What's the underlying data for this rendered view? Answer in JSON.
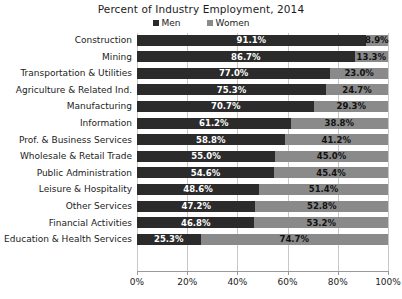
{
  "chart_data": {
    "type": "bar",
    "title": "Percent of Industry Employment, 2014",
    "xlabel": "",
    "ylabel": "",
    "orientation": "horizontal",
    "stacked": true,
    "grid": true,
    "legend_position": "top",
    "xlim": [
      0,
      100
    ],
    "xticks": [
      "0%",
      "20%",
      "40%",
      "60%",
      "80%",
      "100%"
    ],
    "xtick_values": [
      0,
      20,
      40,
      60,
      80,
      100
    ],
    "categories": [
      "Construction",
      "Mining",
      "Transportation & Utilities",
      "Agriculture & Related Ind.",
      "Manufacturing",
      "Information",
      "Prof. & Business Services",
      "Wholesale & Retail Trade",
      "Public Administration",
      "Leisure & Hospitality",
      "Other Services",
      "Financial Activities",
      "Education & Health Services"
    ],
    "series": [
      {
        "name": "Men",
        "color": "#2b2b2b",
        "values": [
          91.1,
          86.7,
          77.0,
          75.3,
          70.7,
          61.2,
          58.8,
          55.0,
          54.6,
          48.6,
          47.2,
          46.8,
          25.3
        ],
        "labels": [
          "91.1%",
          "86.7%",
          "77.0%",
          "75.3%",
          "70.7%",
          "61.2%",
          "58.8%",
          "55.0%",
          "54.6%",
          "48.6%",
          "47.2%",
          "46.8%",
          "25.3%"
        ]
      },
      {
        "name": "Women",
        "color": "#8a8a8a",
        "values": [
          8.9,
          13.3,
          23.0,
          24.7,
          29.3,
          38.8,
          41.2,
          45.0,
          45.4,
          51.4,
          52.8,
          53.2,
          74.7
        ],
        "labels": [
          "8.9%",
          "13.3%",
          "23.0%",
          "24.7%",
          "29.3%",
          "38.8%",
          "41.2%",
          "45.0%",
          "45.4%",
          "51.4%",
          "52.8%",
          "53.2%",
          "74.7%"
        ]
      }
    ]
  }
}
